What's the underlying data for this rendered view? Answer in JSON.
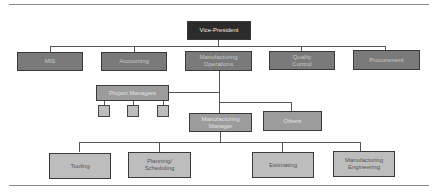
{
  "chart": {
    "type": "org-chart",
    "root": {
      "label": "Vice-President",
      "children": [
        {
          "label": "MIS"
        },
        {
          "label": "Accounting"
        },
        {
          "label": "Manufacturing Operations",
          "children": [
            {
              "label": "Project Managers",
              "children": [
                {
                  "label": ""
                },
                {
                  "label": ""
                },
                {
                  "label": ""
                }
              ]
            },
            {
              "label": "Manufacturing Manager",
              "children": [
                {
                  "label": "Tooling"
                },
                {
                  "label": "Planning/ Scheduling"
                },
                {
                  "label": "Estimating"
                },
                {
                  "label": "Manufacturing Engineering"
                }
              ]
            },
            {
              "label": "Others"
            }
          ]
        },
        {
          "label": "Quality Control"
        },
        {
          "label": "Procurement"
        }
      ]
    }
  },
  "nodes": {
    "vp": "Vice-President",
    "mis": "MIS",
    "accounting": "Accounting",
    "mfg_ops_1": "Manufacturing",
    "mfg_ops_2": "Operations",
    "qc_1": "Quality",
    "qc_2": "Control",
    "procurement": "Procurement",
    "project_managers": "Project Managers",
    "mfg_manager_1": "Manufacturing",
    "mfg_manager_2": "Manager",
    "others": "Others",
    "tooling": "Tooling",
    "planning_1": "Planning/",
    "planning_2": "Scheduling",
    "estimating": "Estimating",
    "mfg_eng_1": "Manufacturing",
    "mfg_eng_2": "Engineering"
  },
  "colors": {
    "level0": "#2b2b2b",
    "level1": "#7a7a7a",
    "level2": "#9c9c9c",
    "level3": "#bdbdbd",
    "connector": "#555555"
  }
}
